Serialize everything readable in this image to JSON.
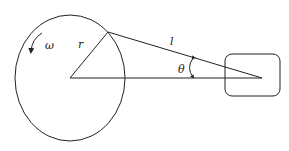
{
  "diagram": {
    "type": "slider-crank mechanism",
    "labels": {
      "omega": "ω",
      "radius": "r",
      "length": "l",
      "angle": "θ"
    },
    "colors": {
      "stroke": "#222222",
      "background": "#ffffff"
    }
  }
}
